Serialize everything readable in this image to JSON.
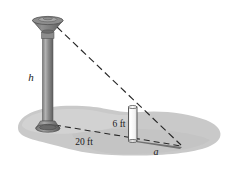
{
  "figure": {
    "labels": {
      "lamp_height": "h",
      "pole_height": "6 ft",
      "base_distance": "20 ft",
      "shadow_length": "a"
    },
    "icons": {
      "lamp": "street-lamp-icon",
      "pole": "vertical-pole-icon",
      "ground": "ground-blob-icon",
      "ray": "dashed-light-ray-icon",
      "shadow": "shadow-wedge-icon"
    },
    "colors": {
      "background": "#ffffff",
      "ground": "#c9c9c9",
      "ground_light": "#d4d4d4",
      "lamp_dark": "#6e6e6e",
      "lamp_mid": "#8a8a8a",
      "lamp_light": "#a8a8a8",
      "pole_fill": "#fbfbfb",
      "pole_stroke": "#4a4a4a",
      "shadow": "#8f8f8f",
      "line": "#2b2b2b",
      "text": "#1a1a1a"
    },
    "geometry": {
      "lamp_base": [
        48,
        126
      ],
      "lamp_top": [
        48,
        22
      ],
      "pole_base": [
        133,
        140
      ],
      "pole_top": [
        133,
        107
      ],
      "shadow_tip": [
        182,
        146
      ],
      "distance_ft": 20,
      "pole_height_ft": 6
    }
  }
}
